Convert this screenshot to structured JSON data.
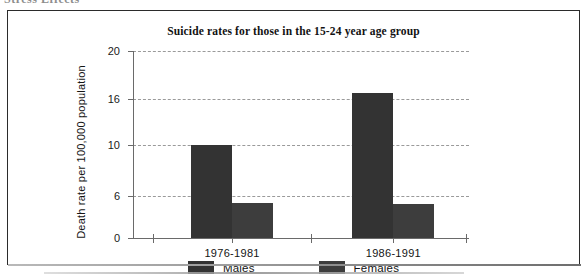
{
  "page": {
    "top_fragment_text": "Stress Effects"
  },
  "figure": {
    "title": "Suicide rates for those in the 15-24 year age group",
    "y_axis_title": "Death rate per 100,000 population"
  },
  "legend": {
    "position": "bottom",
    "items": [
      {
        "label": "Males",
        "color": "#333333"
      },
      {
        "label": "Females",
        "color": "#3d3d3d"
      }
    ]
  },
  "chart_data": {
    "type": "bar",
    "title": "Suicide rates for those in the 15-24 year age group",
    "xlabel": "",
    "ylabel": "Death rate per 100,000 population",
    "categories": [
      "1976-1981",
      "1986-1991"
    ],
    "series": [
      {
        "name": "Males",
        "color": "#333333",
        "values": [
          10.0,
          16.5
        ]
      },
      {
        "name": "Females",
        "color": "#3d3d3d",
        "values": [
          5.0,
          4.8
        ]
      }
    ],
    "ylim": [
      0,
      20
    ],
    "yticks": [
      0,
      6,
      10,
      16,
      20
    ],
    "ytick_labels": [
      "0",
      "6",
      "10",
      "16",
      "20"
    ],
    "ytick_positions_px": [
      197,
      155,
      104,
      58,
      10
    ],
    "grid": true,
    "grid_style": "dashed-horizontal",
    "legend_position": "bottom"
  }
}
